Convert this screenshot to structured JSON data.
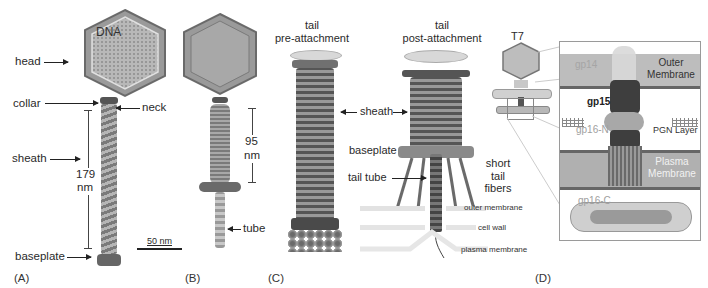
{
  "figure": {
    "panels": [
      {
        "id": "A",
        "letter": "(A)",
        "labels": {
          "head": "head",
          "dna": "DNA",
          "collar": "collar",
          "neck": "neck",
          "sheath": "sheath",
          "length_value": "179",
          "length_unit": "nm",
          "baseplate": "baseplate",
          "scale_bar": "50 nm"
        }
      },
      {
        "id": "B",
        "letter": "(B)",
        "labels": {
          "length_value": "95",
          "length_unit": "nm",
          "tube": "tube"
        }
      },
      {
        "id": "C",
        "letter": "(C)",
        "labels": {
          "pre_title_line1": "tail",
          "pre_title_line2": "pre-attachment",
          "post_title_line1": "tail",
          "post_title_line2": "post-attachment",
          "sheath": "sheath",
          "baseplate": "baseplate",
          "tail_tube": "tail tube",
          "short_tail_fibers_line1": "short",
          "short_tail_fibers_line2": "tail",
          "short_tail_fibers_line3": "fibers",
          "outer_membrane": "outer membrane",
          "cell_wall": "cell wall",
          "plasma_membrane": "plasma membrane"
        }
      },
      {
        "id": "D",
        "letter": "(D)",
        "labels": {
          "phage": "T7",
          "gp14": "gp14",
          "outer_membrane_line1": "Outer",
          "outer_membrane_line2": "Membrane",
          "gp15": "gp15",
          "gp16n": "gp16-N",
          "pgn_layer": "PGN Layer",
          "plasma_membrane_line1": "Plasma",
          "plasma_membrane_line2": "Membrane",
          "gp16c": "gp16-C"
        }
      }
    ],
    "colors": {
      "background": "#ffffff",
      "structure_dark": "#4a4a4a",
      "structure_mid": "#8a8a8a",
      "structure_light": "#c8c8c8",
      "membrane_band": "#bdbdbd",
      "inset_border": "#9a9a9a",
      "label_gray": "#9a9a9a"
    }
  }
}
